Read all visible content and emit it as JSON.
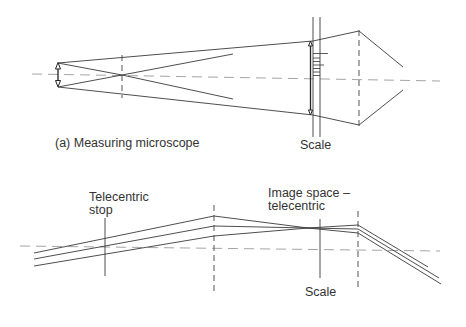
{
  "figure": {
    "top": {
      "caption": "(a)  Measuring microscope",
      "scale_label": "Scale",
      "elements": [
        "object-arrow",
        "objective-lens",
        "optical-axis",
        "scale-plate",
        "image-arrow",
        "scale-graduations",
        "eyepiece-lens"
      ]
    },
    "bottom": {
      "stop_label_line1": "Telecentric",
      "stop_label_line2": "stop",
      "image_label_line1": "Image space –",
      "image_label_line2": "telecentric",
      "scale_label": "Scale",
      "elements": [
        "telecentric-stop",
        "lens-1",
        "scale",
        "lens-2",
        "ray-bundle",
        "optical-axis"
      ]
    },
    "colors": {
      "line": "#3a3a3a",
      "axis": "#9a9a9a",
      "text": "#333333",
      "background": "#ffffff"
    }
  }
}
